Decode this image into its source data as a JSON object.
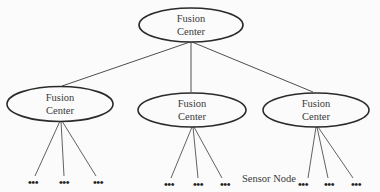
{
  "diagram": {
    "type": "hierarchical-fusion-tree",
    "root": {
      "line1": "Fusion",
      "line2": "Center"
    },
    "children": [
      {
        "line1": "Fusion",
        "line2": "Center",
        "sensors": [
          "•••",
          "•••",
          "•••"
        ]
      },
      {
        "line1": "Fusion",
        "line2": "Center",
        "sensors": [
          "•••",
          "•••",
          "•••"
        ]
      },
      {
        "line1": "Fusion",
        "line2": "Center",
        "sensors": [
          "•••",
          "•••",
          "•••"
        ]
      }
    ],
    "sensor_label": "Sensor Node",
    "colors": {
      "stroke": "#2a2a2a",
      "background": "#fbfbfb",
      "text": "#3a3a3a"
    }
  }
}
